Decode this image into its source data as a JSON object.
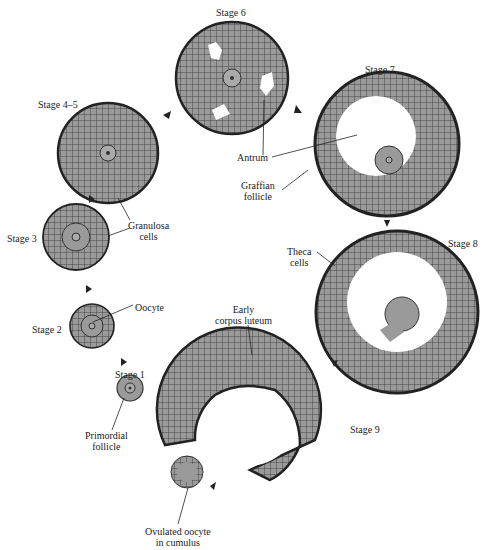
{
  "figure": {
    "colors": {
      "cell_fill": "#9a9a9a",
      "outline": "#2a2a2a",
      "background": "#ffffff"
    },
    "stages": [
      {
        "id": "stage1",
        "label": "Stage 1"
      },
      {
        "id": "stage2",
        "label": "Stage 2"
      },
      {
        "id": "stage3",
        "label": "Stage 3"
      },
      {
        "id": "stage45",
        "label": "Stage 4–5"
      },
      {
        "id": "stage6",
        "label": "Stage 6"
      },
      {
        "id": "stage7",
        "label": "Stage 7"
      },
      {
        "id": "stage8",
        "label": "Stage 8"
      },
      {
        "id": "stage9",
        "label": "Stage 9"
      }
    ],
    "annotations": {
      "primordial": [
        "Primordial",
        "follicle"
      ],
      "oocyte": [
        "Oocyte"
      ],
      "granulosa": [
        "Granulosa",
        "cells"
      ],
      "antrum": [
        "Antrum"
      ],
      "graffian": [
        "Graffian",
        "follicle"
      ],
      "theca": [
        "Theca",
        "cells"
      ],
      "corpus": [
        "Early",
        "corpus luteum"
      ],
      "ovulated": [
        "Ovulated oocyte",
        "in cumulus"
      ]
    }
  }
}
